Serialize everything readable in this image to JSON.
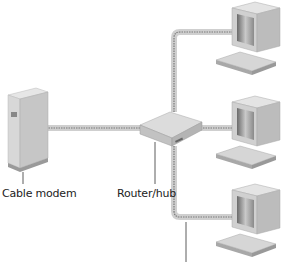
{
  "diagram": {
    "labels": {
      "cable_modem": "Cable modem",
      "router_hub": "Router/hub"
    },
    "nodes": [
      {
        "id": "cable-modem",
        "type": "cable-modem-icon"
      },
      {
        "id": "router-hub",
        "type": "router-icon"
      },
      {
        "id": "computer-1",
        "type": "computer-icon"
      },
      {
        "id": "computer-2",
        "type": "computer-icon"
      },
      {
        "id": "computer-3",
        "type": "computer-icon"
      }
    ],
    "connections": [
      {
        "from": "cable-modem",
        "to": "router-hub"
      },
      {
        "from": "router-hub",
        "to": "computer-1"
      },
      {
        "from": "router-hub",
        "to": "computer-2"
      },
      {
        "from": "router-hub",
        "to": "computer-3"
      }
    ],
    "colors": {
      "cable_outer": "#c8c8c8",
      "cable_dash": "#777777",
      "device_light": "#e2e2e2",
      "device_mid": "#c4c4c4",
      "device_dark": "#8a8a8a"
    }
  }
}
